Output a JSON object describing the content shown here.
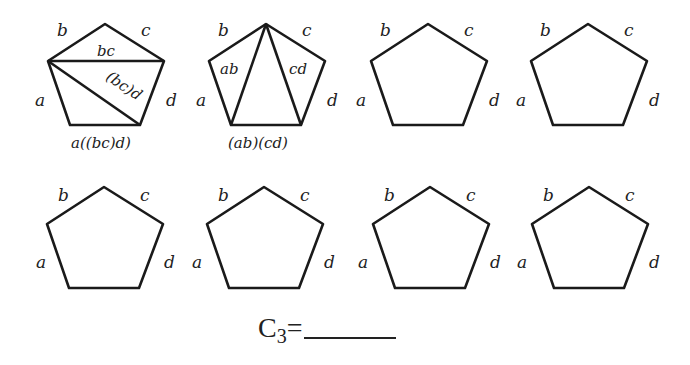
{
  "figure": {
    "edge_labels": [
      "a",
      "b",
      "c",
      "d"
    ],
    "pentagons": [
      {
        "id": 1,
        "row": 1,
        "col": 1,
        "diagonals": [
          "upper-left to upper-right",
          "upper-left to lower-right"
        ],
        "inner_labels": [
          "bc",
          "(bc)d"
        ],
        "bottom_label": "a((bc)d)"
      },
      {
        "id": 2,
        "row": 1,
        "col": 2,
        "diagonals": [
          "top to lower-left",
          "top to lower-right"
        ],
        "inner_labels": [
          "ab",
          "cd"
        ],
        "bottom_label": "(ab)(cd)"
      },
      {
        "id": 3,
        "row": 1,
        "col": 3,
        "diagonals": [],
        "inner_labels": [],
        "bottom_label": ""
      },
      {
        "id": 4,
        "row": 1,
        "col": 4,
        "diagonals": [],
        "inner_labels": [],
        "bottom_label": ""
      },
      {
        "id": 5,
        "row": 2,
        "col": 1,
        "diagonals": [],
        "inner_labels": [],
        "bottom_label": ""
      },
      {
        "id": 6,
        "row": 2,
        "col": 2,
        "diagonals": [],
        "inner_labels": [],
        "bottom_label": ""
      },
      {
        "id": 7,
        "row": 2,
        "col": 3,
        "diagonals": [],
        "inner_labels": [],
        "bottom_label": ""
      },
      {
        "id": 8,
        "row": 2,
        "col": 4,
        "diagonals": [],
        "inner_labels": [],
        "bottom_label": ""
      }
    ]
  },
  "caption": {
    "symbol": "C",
    "subscript": "3",
    "equals": "=",
    "answer": ""
  }
}
